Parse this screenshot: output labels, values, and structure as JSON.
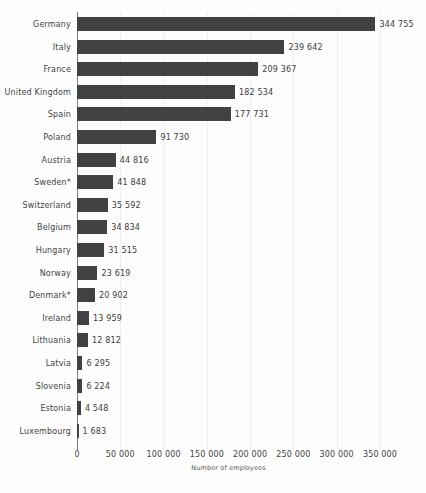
{
  "chart_data": {
    "type": "bar",
    "orientation": "horizontal",
    "title": "",
    "subtitle": "",
    "xlabel": "Number of employees",
    "ylabel": "",
    "xlim": [
      0,
      350000
    ],
    "xticks": [
      0,
      50000,
      100000,
      150000,
      200000,
      250000,
      300000,
      350000
    ],
    "xtick_labels": [
      "0",
      "50 000",
      "100 000",
      "150 000",
      "200 000",
      "250 000",
      "300 000",
      "350 000"
    ],
    "grid": "vertical",
    "legend": null,
    "bar_color": "#424242",
    "categories": [
      "Germany",
      "Italy",
      "France",
      "United Kingdom",
      "Spain",
      "Poland",
      "Austria",
      "Sweden*",
      "Switzerland",
      "Belgium",
      "Hungary",
      "Norway",
      "Denmark*",
      "Ireland",
      "Lithuania",
      "Latvia",
      "Slovenia",
      "Estonia",
      "Luxembourg"
    ],
    "values": [
      344755,
      239642,
      209367,
      182534,
      177731,
      91730,
      44816,
      41848,
      35592,
      34834,
      31515,
      23619,
      20902,
      13959,
      12812,
      6295,
      6224,
      4548,
      1683
    ],
    "value_labels": [
      "344 755",
      "239 642",
      "209 367",
      "182 534",
      "177 731",
      "91 730",
      "44 816",
      "41 848",
      "35 592",
      "34 834",
      "31 515",
      "23 619",
      "20 902",
      "13 959",
      "12 812",
      "6 295",
      "6 224",
      "4 548",
      "1 683"
    ],
    "annotations": [
      "* asterisk marks Sweden and Denmark category labels"
    ]
  }
}
